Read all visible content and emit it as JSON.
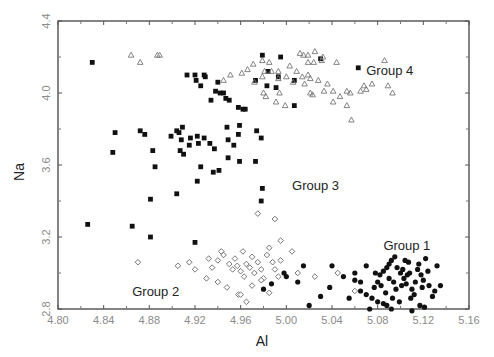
{
  "chart_data": {
    "type": "scatter",
    "title": "",
    "xlabel": "Al",
    "ylabel": "Na",
    "xlim": [
      4.8,
      5.16
    ],
    "ylim": [
      2.8,
      4.4
    ],
    "grid": false,
    "legend": "none (group labels annotated in plot)",
    "x_ticks": [
      "4.80",
      "4.84",
      "4.88",
      "4.92",
      "4.96",
      "5.00",
      "5.04",
      "5.08",
      "5.12",
      "5.16"
    ],
    "y_ticks": [
      "2.8",
      "3.2",
      "3.6",
      "4.0",
      "4.4"
    ],
    "annotations": [
      {
        "text": "Group 4",
        "x": 5.07,
        "y": 4.1
      },
      {
        "text": "Group 3",
        "x": 5.005,
        "y": 3.46
      },
      {
        "text": "Group 1",
        "x": 5.085,
        "y": 3.13
      },
      {
        "text": "Group 2",
        "x": 4.865,
        "y": 2.87
      }
    ],
    "series": [
      {
        "name": "Group 1",
        "marker": "filled-circle",
        "points": [
          [
            5.015,
            3.04
          ],
          [
            5.04,
            3.04
          ],
          [
            5.07,
            3.04
          ],
          [
            5.038,
            2.92
          ],
          [
            5.06,
            2.96
          ],
          [
            5.03,
            2.87
          ],
          [
            5.055,
            2.86
          ],
          [
            5.02,
            2.82
          ],
          [
            5.065,
            2.9
          ],
          [
            5.07,
            2.88
          ],
          [
            5.077,
            2.92
          ],
          [
            5.08,
            2.95
          ],
          [
            5.082,
            2.99
          ],
          [
            5.085,
            3.01
          ],
          [
            5.088,
            3.03
          ],
          [
            5.09,
            3.05
          ],
          [
            5.092,
            3.07
          ],
          [
            5.095,
            3.09
          ],
          [
            5.097,
            3.03
          ],
          [
            5.1,
            3.0
          ],
          [
            5.103,
            2.97
          ],
          [
            5.105,
            2.94
          ],
          [
            5.107,
            3.06
          ],
          [
            5.11,
            2.91
          ],
          [
            5.112,
            2.88
          ],
          [
            5.115,
            3.02
          ],
          [
            5.118,
            2.99
          ],
          [
            5.12,
            2.96
          ],
          [
            5.122,
            3.08
          ],
          [
            5.125,
            2.93
          ],
          [
            5.13,
            2.9
          ],
          [
            5.132,
            3.04
          ],
          [
            5.078,
            3.0
          ],
          [
            5.083,
            2.93
          ],
          [
            5.087,
            2.89
          ],
          [
            5.09,
            2.97
          ],
          [
            5.093,
            2.86
          ],
          [
            5.096,
            2.91
          ],
          [
            5.099,
            2.84
          ],
          [
            5.102,
            3.02
          ],
          [
            5.106,
            2.99
          ],
          [
            5.109,
            2.86
          ],
          [
            5.113,
            2.95
          ],
          [
            5.116,
            3.05
          ],
          [
            5.119,
            2.92
          ],
          [
            5.124,
            3.01
          ],
          [
            5.128,
            2.87
          ],
          [
            5.135,
            2.93
          ],
          [
            5.075,
            2.86
          ],
          [
            5.08,
            2.84
          ],
          [
            5.085,
            2.83
          ],
          [
            5.088,
            2.82
          ],
          [
            5.094,
            2.95
          ],
          [
            5.101,
            2.93
          ],
          [
            5.104,
            3.07
          ],
          [
            5.108,
            3.0
          ],
          [
            5.117,
            2.82
          ],
          [
            5.121,
            2.81
          ],
          [
            5.073,
            2.8
          ],
          [
            5.092,
            2.8
          ],
          [
            5.11,
            2.79
          ],
          [
            5.06,
            3.0
          ],
          [
            5.05,
            2.98
          ],
          [
            5.065,
            2.95
          ],
          [
            4.998,
            3.0
          ],
          [
            4.98,
            2.91
          ],
          [
            4.987,
            2.94
          ],
          [
            5.01,
            2.95
          ],
          [
            5.0,
            2.98
          ]
        ]
      },
      {
        "name": "Group 2",
        "marker": "open-diamond",
        "points": [
          [
            4.87,
            3.06
          ],
          [
            4.905,
            3.04
          ],
          [
            4.915,
            3.06
          ],
          [
            4.92,
            3.02
          ],
          [
            4.932,
            3.08
          ],
          [
            4.935,
            3.03
          ],
          [
            4.94,
            3.07
          ],
          [
            4.943,
            3.12
          ],
          [
            4.945,
            3.1
          ],
          [
            4.95,
            3.05
          ],
          [
            4.953,
            3.02
          ],
          [
            4.955,
            3.08
          ],
          [
            4.957,
            3.04
          ],
          [
            4.96,
            3.01
          ],
          [
            4.962,
            3.12
          ],
          [
            4.965,
            3.05
          ],
          [
            4.968,
            3.03
          ],
          [
            4.97,
            3.09
          ],
          [
            4.972,
            3.0
          ],
          [
            4.975,
            3.06
          ],
          [
            4.978,
            3.02
          ],
          [
            4.98,
            2.97
          ],
          [
            4.983,
            3.1
          ],
          [
            4.985,
            3.14
          ],
          [
            4.988,
            3.06
          ],
          [
            4.99,
            3.02
          ],
          [
            4.993,
            2.98
          ],
          [
            4.995,
            3.07
          ],
          [
            4.93,
            2.97
          ],
          [
            4.94,
            2.95
          ],
          [
            4.948,
            2.92
          ],
          [
            4.958,
            2.88
          ],
          [
            4.963,
            2.98
          ],
          [
            4.97,
            2.93
          ],
          [
            4.978,
            2.96
          ],
          [
            4.985,
            2.89
          ],
          [
            4.995,
            3.18
          ],
          [
            5.005,
            3.12
          ],
          [
            5.01,
            3.0
          ],
          [
            5.025,
            2.98
          ],
          [
            5.045,
            3.0
          ],
          [
            4.96,
            2.88
          ],
          [
            5.06,
            2.9
          ],
          [
            4.975,
            3.33
          ],
          [
            4.99,
            3.3
          ],
          [
            4.965,
            2.84
          ]
        ]
      },
      {
        "name": "Group 3",
        "marker": "filled-square",
        "points": [
          [
            4.83,
            4.17
          ],
          [
            4.913,
            4.1
          ],
          [
            4.92,
            4.1
          ],
          [
            4.921,
            4.07
          ],
          [
            4.928,
            4.1
          ],
          [
            4.929,
            4.09
          ],
          [
            4.925,
            4.04
          ],
          [
            4.94,
            4.06
          ],
          [
            4.938,
            4.01
          ],
          [
            4.942,
            4.0
          ],
          [
            4.945,
            4.0
          ],
          [
            4.934,
            3.96
          ],
          [
            4.95,
            3.96
          ],
          [
            4.947,
            3.97
          ],
          [
            4.958,
            3.92
          ],
          [
            4.962,
            3.91
          ],
          [
            4.964,
            3.91
          ],
          [
            4.973,
            4.07
          ],
          [
            4.984,
            4.12
          ],
          [
            4.983,
            4.04
          ],
          [
            4.993,
            4.09
          ],
          [
            5.007,
            4.07
          ],
          [
            5.007,
            3.93
          ],
          [
            5.03,
            4.19
          ],
          [
            5.063,
            4.14
          ],
          [
            4.979,
            4.21
          ],
          [
            4.995,
            4.2
          ],
          [
            4.991,
            4.03
          ],
          [
            4.904,
            3.79
          ],
          [
            4.909,
            3.81
          ],
          [
            4.906,
            3.78
          ],
          [
            4.899,
            3.76
          ],
          [
            4.908,
            3.74
          ],
          [
            4.915,
            3.71
          ],
          [
            4.916,
            3.75
          ],
          [
            4.907,
            3.68
          ],
          [
            4.91,
            3.66
          ],
          [
            4.922,
            3.76
          ],
          [
            4.928,
            3.75
          ],
          [
            4.923,
            3.72
          ],
          [
            4.933,
            3.72
          ],
          [
            4.937,
            3.69
          ],
          [
            4.949,
            3.74
          ],
          [
            4.954,
            3.71
          ],
          [
            4.949,
            3.64
          ],
          [
            4.941,
            3.57
          ],
          [
            4.925,
            3.59
          ],
          [
            4.922,
            3.51
          ],
          [
            4.936,
            3.56
          ],
          [
            4.959,
            3.62
          ],
          [
            4.958,
            3.77
          ],
          [
            4.948,
            3.81
          ],
          [
            4.959,
            3.82
          ],
          [
            4.974,
            3.79
          ],
          [
            4.978,
            3.75
          ],
          [
            4.973,
            3.62
          ],
          [
            4.979,
            3.47
          ],
          [
            4.978,
            3.4
          ],
          [
            4.883,
            3.68
          ],
          [
            4.885,
            3.59
          ],
          [
            4.904,
            3.44
          ],
          [
            4.848,
            3.67
          ],
          [
            4.881,
            3.41
          ],
          [
            4.865,
            3.26
          ],
          [
            4.826,
            3.27
          ],
          [
            4.881,
            3.2
          ],
          [
            4.92,
            3.17
          ],
          [
            4.85,
            3.78
          ],
          [
            4.872,
            3.79
          ],
          [
            4.876,
            3.77
          ]
        ]
      },
      {
        "name": "Group 4",
        "marker": "open-triangle",
        "points": [
          [
            4.864,
            4.21
          ],
          [
            4.872,
            4.17
          ],
          [
            4.887,
            4.21
          ],
          [
            4.889,
            4.21
          ],
          [
            4.951,
            4.1
          ],
          [
            4.945,
            4.07
          ],
          [
            4.961,
            4.11
          ],
          [
            4.966,
            4.13
          ],
          [
            4.979,
            4.18
          ],
          [
            4.985,
            4.17
          ],
          [
            4.971,
            4.16
          ],
          [
            4.981,
            4.12
          ],
          [
            4.987,
            4.12
          ],
          [
            5.003,
            4.15
          ],
          [
            4.979,
            4.09
          ],
          [
            4.993,
            4.12
          ],
          [
            4.993,
            4.08
          ],
          [
            5.0,
            4.09
          ],
          [
            5.009,
            4.12
          ],
          [
            5.015,
            4.21
          ],
          [
            5.012,
            4.22
          ],
          [
            5.019,
            4.21
          ],
          [
            5.024,
            4.17
          ],
          [
            5.025,
            4.23
          ],
          [
            5.019,
            4.17
          ],
          [
            5.032,
            4.2
          ],
          [
            5.031,
            4.18
          ],
          [
            5.044,
            4.17
          ],
          [
            5.006,
            4.06
          ],
          [
            5.014,
            4.09
          ],
          [
            5.019,
            4.1
          ],
          [
            5.016,
            4.05
          ],
          [
            5.021,
            4.08
          ],
          [
            5.028,
            4.07
          ],
          [
            5.033,
            4.01
          ],
          [
            5.021,
            4.0
          ],
          [
            5.023,
            3.99
          ],
          [
            5.041,
            4.01
          ],
          [
            5.047,
            3.98
          ],
          [
            5.065,
            4.01
          ],
          [
            5.068,
            4.04
          ],
          [
            5.07,
            4.02
          ],
          [
            5.056,
            4.0
          ],
          [
            5.086,
            4.18
          ],
          [
            5.053,
            4.01
          ],
          [
            4.994,
            4.0
          ],
          [
            4.972,
            4.06
          ],
          [
            4.98,
            4.0
          ],
          [
            4.982,
            3.98
          ],
          [
            4.991,
            3.95
          ],
          [
            4.999,
            3.93
          ],
          [
            5.036,
            4.05
          ],
          [
            5.053,
            3.93
          ],
          [
            5.075,
            4.05
          ],
          [
            5.089,
            4.04
          ],
          [
            5.093,
            4.0
          ],
          [
            5.057,
            3.85
          ],
          [
            5.041,
            3.95
          ]
        ]
      }
    ]
  }
}
